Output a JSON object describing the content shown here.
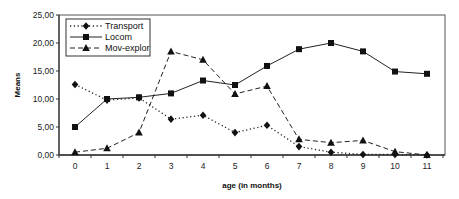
{
  "chart_data": {
    "type": "line",
    "title": "",
    "xlabel": "age (in months)",
    "ylabel": "Means",
    "categories": [
      "0",
      "1",
      "2",
      "3",
      "4",
      "5",
      "6",
      "7",
      "8",
      "9",
      "10",
      "11"
    ],
    "ylim": [
      0,
      25
    ],
    "yticks": [
      "0,00",
      "5,00",
      "10,00",
      "15,00",
      "20,00",
      "25,00"
    ],
    "ytick_values": [
      0,
      5,
      10,
      15,
      20,
      25
    ],
    "grid": false,
    "legend_position": "top-left inside",
    "series": [
      {
        "name": "Transport",
        "line_style": "dotted",
        "marker": "diamond",
        "values": [
          12.6,
          9.8,
          10.2,
          6.4,
          7.1,
          4.0,
          5.3,
          1.5,
          0.5,
          0.1,
          0.1,
          0.0
        ]
      },
      {
        "name": "Locom",
        "line_style": "solid",
        "marker": "square",
        "values": [
          5.0,
          10.0,
          10.3,
          11.0,
          13.3,
          12.5,
          15.9,
          18.9,
          20.0,
          18.5,
          14.9,
          14.5
        ]
      },
      {
        "name": "Mov-explor",
        "line_style": "dashed",
        "marker": "triangle",
        "values": [
          0.5,
          1.2,
          4.0,
          18.5,
          17.0,
          10.9,
          12.3,
          2.8,
          2.2,
          2.6,
          0.6,
          0.0
        ]
      }
    ]
  }
}
